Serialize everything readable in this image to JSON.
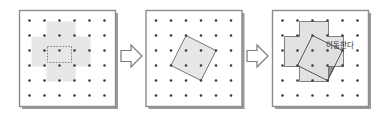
{
  "figure": {
    "panel_count": 3,
    "grid": {
      "rows": 6,
      "cols": 6,
      "dot_color": "#3a3a3a",
      "dot_radius": 1.3
    },
    "panel_border_color": "#8c8c8c",
    "panel_fill": "#ffffff",
    "shadow_color": "#9a9a9a",
    "arrow_color": "#7a7a7a",
    "shape_light_fill": "#e3e3e3",
    "shape_dark_fill": "#8f8f8f",
    "shape_outline": "#6e6e6e",
    "dashed_outline": "#555555"
  },
  "panels": [
    {
      "id": "panel-1",
      "name": "plus-shape-panel",
      "label": "",
      "shape": "plus",
      "shape_name": "cross-shape",
      "annotation": "",
      "inner_label": ""
    },
    {
      "id": "panel-2",
      "name": "rotated-square-panel",
      "label": "",
      "shape": "rotated-square",
      "shape_name": "tilted-square",
      "annotation": ""
    },
    {
      "id": "panel-3",
      "name": "overlap-panel",
      "label": "",
      "shape": "plus-over-rotated-square",
      "shape_name": "overlapped-shapes",
      "annotation": "이동한다"
    }
  ],
  "arrows": [
    {
      "id": "arrow-1",
      "name": "transition-arrow-1",
      "direction": "right",
      "label": ""
    },
    {
      "id": "arrow-2",
      "name": "transition-arrow-2",
      "direction": "right",
      "label": ""
    }
  ],
  "annotations": {
    "move_text": "이동한다"
  },
  "colors": {
    "border": "#8c8c8c",
    "dot": "#3a3a3a",
    "light_gray": "#e3e3e3",
    "dark_gray": "#8f8f8f",
    "outline": "#6e6e6e",
    "arrow": "#7a7a7a",
    "text": "#2b2b2b"
  }
}
